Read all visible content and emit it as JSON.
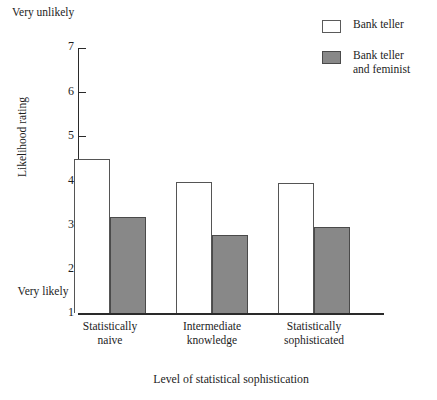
{
  "colors": {
    "bar_open_fill": "#ffffff",
    "bar_open_stroke": "#555555",
    "bar_filled_fill": "#888888",
    "bar_filled_stroke": "#4a4a4a",
    "axis": "#2a2a2a",
    "text": "#1d1d1d",
    "background": "#ffffff"
  },
  "axis_annotations": {
    "top_left": "Very\nunlikely",
    "bottom_left": "Very\nlikely"
  },
  "legend": {
    "position": "top-right",
    "entries": [
      {
        "label": "Bank teller",
        "swatch": "open-square-icon",
        "color": "#ffffff"
      },
      {
        "label": "Bank teller\nand feminist",
        "swatch": "filled-square-icon",
        "color": "#888888"
      }
    ]
  },
  "chart_data": {
    "type": "bar",
    "title": "",
    "subtitle": "",
    "xlabel": "Level of statistical sophistication",
    "ylabel": "Likelihood rating",
    "categories": [
      "Statistically\nnaive",
      "Intermediate\nknowledge",
      "Statistically\nsophisticated"
    ],
    "series": [
      {
        "name": "Bank teller",
        "values": [
          4.48,
          3.97,
          3.95
        ],
        "style": "open"
      },
      {
        "name": "Bank teller and feminist",
        "values": [
          3.17,
          2.77,
          2.95
        ],
        "style": "filled"
      }
    ],
    "ylim": [
      1,
      7
    ],
    "yticks": [
      7,
      6,
      5,
      4,
      3,
      2,
      1
    ],
    "ytick_labels": [
      "7",
      "6",
      "5",
      "4",
      "3",
      "2",
      "1"
    ],
    "y_axis_note_high": "Very unlikely",
    "y_axis_note_low": "Very likely",
    "grid": false,
    "legend_position": "top-right",
    "grouped": true,
    "bars_adjacent": true
  }
}
